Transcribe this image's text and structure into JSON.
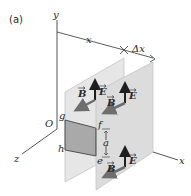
{
  "figure": {
    "panel_label": "(a)",
    "axes": {
      "y_label": "y",
      "z_label": "z",
      "x_label": "x",
      "origin_label": "O"
    },
    "dimensions": {
      "distance_label": "x",
      "delta_label": "Δx"
    },
    "rectangle_corners": {
      "g": "g",
      "h": "h",
      "e": "e",
      "f": "f"
    },
    "side_label": "a",
    "field_vectors": {
      "electric": "E",
      "magnetic": "B"
    },
    "colors": {
      "plane_fill": "#e3e3e3",
      "plane_edge": "#bdbdbd",
      "rect_fill": "#a8a8a8",
      "arrow_dark": "#1e1e1e",
      "b_arrow": "#6e6e6e",
      "line": "#333333"
    }
  }
}
